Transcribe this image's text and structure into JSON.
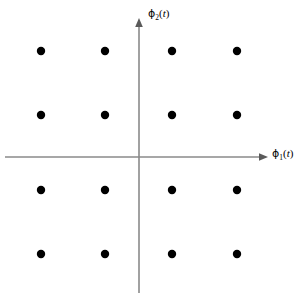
{
  "figure": {
    "background_color": "#ffffff"
  },
  "axes": {
    "color": "#8a8a8a",
    "line_width": 1.6,
    "origin": {
      "x": 139,
      "y": 157
    },
    "horizontal": {
      "name": "phi1-axis",
      "start_x": 5,
      "end_x": 268,
      "y": 157,
      "arrow": "right",
      "label_text": "ϕ",
      "label_subscript": "1",
      "label_arg": "(t)",
      "label_full": "ϕ1(t)"
    },
    "vertical": {
      "name": "phi2-axis",
      "x": 139,
      "start_y": 293,
      "end_y": 18,
      "arrow": "up",
      "label_text": "ϕ",
      "label_subscript": "2",
      "label_arg": "(t)",
      "label_full": "ϕ2(t)"
    }
  },
  "chart_data": {
    "type": "scatter",
    "title": "",
    "xlabel": "ϕ1(t)",
    "ylabel": "ϕ2(t)",
    "grid": false,
    "legend": "none",
    "point_color": "#000000",
    "point_radius": 4.2,
    "xlim": [
      -3,
      3
    ],
    "ylim": [
      -3,
      3
    ],
    "x_levels": [
      -3,
      -1,
      1,
      3
    ],
    "y_levels": [
      3,
      1,
      -1,
      -3
    ],
    "pixel_x_levels": [
      41,
      105,
      172,
      237
    ],
    "pixel_y_levels": [
      51,
      115,
      190,
      254
    ],
    "series": [
      {
        "name": "16-QAM constellation points",
        "x": [
          -3,
          -1,
          1,
          3,
          -3,
          -1,
          1,
          3,
          -3,
          -1,
          1,
          3,
          -3,
          -1,
          1,
          3
        ],
        "y": [
          3,
          3,
          3,
          3,
          1,
          1,
          1,
          1,
          -1,
          -1,
          -1,
          -1,
          -3,
          -3,
          -3,
          -3
        ]
      }
    ],
    "points_pixel": [
      {
        "cx": 41,
        "cy": 51
      },
      {
        "cx": 105,
        "cy": 51
      },
      {
        "cx": 172,
        "cy": 51
      },
      {
        "cx": 237,
        "cy": 51
      },
      {
        "cx": 41,
        "cy": 115
      },
      {
        "cx": 105,
        "cy": 115
      },
      {
        "cx": 172,
        "cy": 115
      },
      {
        "cx": 237,
        "cy": 115
      },
      {
        "cx": 41,
        "cy": 190
      },
      {
        "cx": 105,
        "cy": 190
      },
      {
        "cx": 172,
        "cy": 190
      },
      {
        "cx": 237,
        "cy": 190
      },
      {
        "cx": 41,
        "cy": 254
      },
      {
        "cx": 105,
        "cy": 254
      },
      {
        "cx": 172,
        "cy": 254
      },
      {
        "cx": 237,
        "cy": 254
      }
    ],
    "point_count": 16
  }
}
